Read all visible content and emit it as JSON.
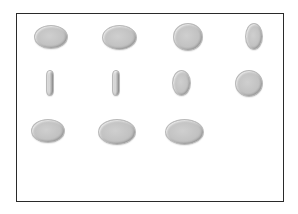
{
  "figure": {
    "frame": {
      "border_color": "#2a2a2a",
      "background": "#ffffff"
    },
    "coin_color": "#c2c2c2",
    "rows": [
      {
        "row": 1,
        "coins": [
          {
            "id": 1,
            "view": "face-tilted",
            "x": 34,
            "y": 25,
            "w": 34,
            "h": 24
          },
          {
            "id": 2,
            "view": "face-tilted",
            "x": 102,
            "y": 25,
            "w": 35,
            "h": 25
          },
          {
            "id": 3,
            "view": "face-near-frontal",
            "x": 173,
            "y": 23,
            "w": 30,
            "h": 28
          },
          {
            "id": 4,
            "view": "rotating-oval",
            "x": 245,
            "y": 23,
            "w": 18,
            "h": 27
          }
        ]
      },
      {
        "row": 2,
        "coins": [
          {
            "id": 5,
            "view": "edge-on",
            "x": 46,
            "y": 70,
            "w": 8,
            "h": 26
          },
          {
            "id": 6,
            "view": "edge-on",
            "x": 112,
            "y": 70,
            "w": 8,
            "h": 26
          },
          {
            "id": 7,
            "view": "rotating-oval",
            "x": 172,
            "y": 70,
            "w": 19,
            "h": 26
          },
          {
            "id": 8,
            "view": "face-near-frontal",
            "x": 235,
            "y": 70,
            "w": 28,
            "h": 27
          }
        ]
      },
      {
        "row": 3,
        "coins": [
          {
            "id": 9,
            "view": "face-tilted",
            "x": 31,
            "y": 119,
            "w": 34,
            "h": 24
          },
          {
            "id": 10,
            "view": "face-tilted",
            "x": 98,
            "y": 119,
            "w": 38,
            "h": 26
          },
          {
            "id": 11,
            "view": "face-tilted",
            "x": 165,
            "y": 119,
            "w": 39,
            "h": 26
          }
        ]
      }
    ]
  }
}
